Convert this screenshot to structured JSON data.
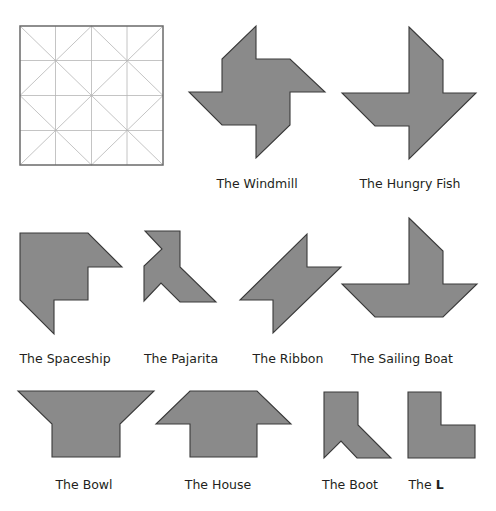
{
  "header": {
    "partial_title": "...g p..."
  },
  "colors": {
    "fill": "#8a8a8a",
    "stroke": "#3a3a3a",
    "grid": "#b5b5b5"
  },
  "grid": {
    "name": "Tangram dissection grid"
  },
  "shapes": [
    {
      "id": "windmill",
      "label": "The Windmill"
    },
    {
      "id": "hungry-fish",
      "label": "The Hungry Fish"
    },
    {
      "id": "spaceship",
      "label": "The Spaceship"
    },
    {
      "id": "pajarita",
      "label": "The Pajarita"
    },
    {
      "id": "ribbon",
      "label": "The Ribbon"
    },
    {
      "id": "sailing-boat",
      "label": "The Sailing Boat"
    },
    {
      "id": "bowl",
      "label": "The Bowl"
    },
    {
      "id": "house",
      "label": "The House"
    },
    {
      "id": "boot",
      "label": "The Boot"
    },
    {
      "id": "l",
      "label_prefix": "The ",
      "label_bold": "L"
    }
  ]
}
